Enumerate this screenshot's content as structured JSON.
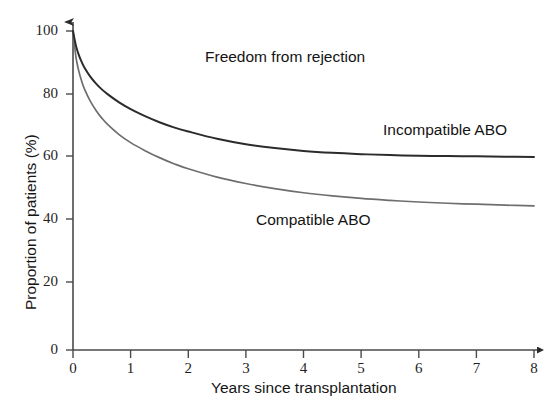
{
  "chart_data": {
    "type": "line",
    "title": "",
    "xlabel": "Years since transplantation",
    "ylabel": "Proportion of patients (%)",
    "xlim": [
      0,
      8
    ],
    "ylim": [
      0,
      100
    ],
    "xticks": [
      "0",
      "1",
      "2",
      "3",
      "4",
      "5",
      "6",
      "7",
      "8"
    ],
    "yticks": [
      "0",
      "20",
      "40",
      "60",
      "80",
      "100"
    ],
    "grid": false,
    "legend_position": "inline-annotations",
    "annotations": [
      {
        "text": "Freedom from rejection",
        "x": 3.3,
        "y": 90
      },
      {
        "text": "Incompatible ABO",
        "x": 6.3,
        "y": 67
      },
      {
        "text": "Compatible ABO",
        "x": 4.1,
        "y": 41
      }
    ],
    "x": [
      0,
      0.05,
      0.1,
      0.15,
      0.2,
      0.3,
      0.4,
      0.5,
      0.6,
      0.8,
      1.0,
      1.25,
      1.5,
      1.75,
      2.0,
      2.5,
      3.0,
      3.5,
      4.0,
      4.5,
      5.0,
      5.5,
      6.0,
      6.5,
      7.0,
      7.5,
      8.0
    ],
    "series": [
      {
        "name": "Incompatible ABO",
        "color": "#2b2b2b",
        "values": [
          100,
          95.5,
          92.5,
          90.3,
          88.5,
          85.7,
          83.5,
          81.7,
          80.2,
          77.6,
          75.5,
          73.3,
          71.4,
          69.8,
          68.5,
          66.2,
          64.5,
          63.3,
          62.4,
          61.8,
          61.4,
          61.1,
          60.9,
          60.8,
          60.7,
          60.6,
          60.5
        ]
      },
      {
        "name": "Compatible ABO",
        "color": "#6e6e6e",
        "values": [
          100,
          92.0,
          87.5,
          84.3,
          81.8,
          78.0,
          75.1,
          72.7,
          70.7,
          67.5,
          65.0,
          62.5,
          60.3,
          58.4,
          56.8,
          54.2,
          52.2,
          50.6,
          49.3,
          48.3,
          47.5,
          46.9,
          46.4,
          46.0,
          45.7,
          45.4,
          45.2
        ]
      }
    ]
  },
  "axes": {
    "y_title": "Proportion of patients (%)",
    "x_title": "Years since transplantation",
    "y_tick_labels": [
      "100",
      "80",
      "60",
      "40",
      "20",
      "0"
    ],
    "x_tick_labels": [
      "0",
      "1",
      "2",
      "3",
      "4",
      "5",
      "6",
      "7",
      "8"
    ]
  },
  "labels": {
    "headline": "Freedom from rejection",
    "series_upper": "Incompatible ABO",
    "series_lower": "Compatible ABO"
  }
}
